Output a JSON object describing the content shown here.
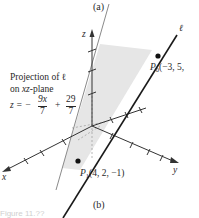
{
  "figure": {
    "top_caption": "(a)",
    "bottom_caption": "(b)",
    "figure_number_faint": "Figure 11.??"
  },
  "axes": {
    "x_label": "x",
    "y_label": "y",
    "z_label": "z"
  },
  "line": {
    "label": "ℓ",
    "p0": {
      "name": "P",
      "sub": "0",
      "coords": "(−3, 5,"
    },
    "p1": {
      "name": "P",
      "sub": "1",
      "coords": "(4, 2, −1)"
    }
  },
  "projection": {
    "line1": "Projection of ℓ",
    "line2_prefix": "on ",
    "line2_var": "xz",
    "line2_suffix": "-plane",
    "eq_lhs": "z = −",
    "frac1_num": "9x",
    "frac1_den": "7",
    "plus": "+",
    "frac2_num": "29",
    "frac2_den": "7"
  },
  "colors": {
    "plane_fill": "#e6e6e6",
    "line": "#1a1a1a",
    "axis": "#333333",
    "projection_line": "#8a8a8a"
  }
}
